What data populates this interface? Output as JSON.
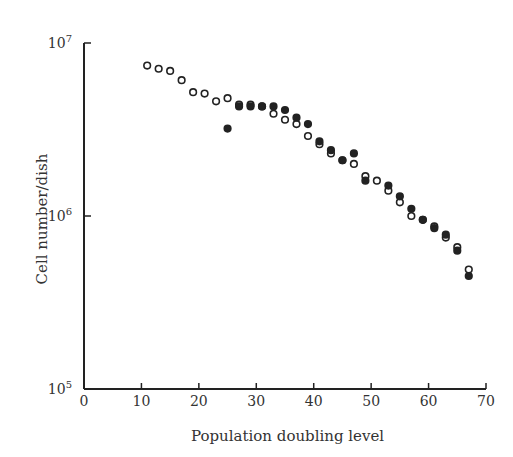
{
  "chart_data": {
    "type": "scatter",
    "title": "",
    "xlabel": "Population doubling level",
    "ylabel": "Cell number/dish",
    "xlim": [
      0,
      70
    ],
    "ylim": [
      100000,
      10000000
    ],
    "yscale": "log",
    "x_ticks": [
      "0",
      "10",
      "20",
      "30",
      "40",
      "50",
      "60",
      "70"
    ],
    "y_ticks": [
      "10^5",
      "10^6",
      "10^7"
    ],
    "grid": false,
    "legend": null,
    "series": [
      {
        "name": "open circles",
        "marker": "open",
        "x": [
          11,
          13,
          15,
          17,
          19,
          21,
          23,
          25,
          27,
          29,
          31,
          33,
          35,
          37,
          39,
          41,
          43,
          45,
          47,
          49,
          51,
          53,
          55,
          57,
          59,
          61,
          63,
          65,
          67
        ],
        "y": [
          7400000,
          7100000,
          6900000,
          6100000,
          5200000,
          5100000,
          4600000,
          4800000,
          4400000,
          4400000,
          4300000,
          3900000,
          3600000,
          3400000,
          2900000,
          2600000,
          2300000,
          2100000,
          2000000,
          1700000,
          1600000,
          1400000,
          1200000,
          1000000,
          950000,
          870000,
          750000,
          660000,
          490000
        ]
      },
      {
        "name": "filled circles",
        "marker": "filled",
        "x": [
          25,
          27,
          29,
          31,
          33,
          35,
          37,
          39,
          41,
          43,
          45,
          47,
          49,
          53,
          55,
          57,
          59,
          61,
          63,
          65,
          67
        ],
        "y": [
          3200000,
          4300000,
          4300000,
          4300000,
          4300000,
          4100000,
          3700000,
          3400000,
          2700000,
          2400000,
          2100000,
          2300000,
          1600000,
          1500000,
          1300000,
          1100000,
          950000,
          850000,
          780000,
          630000,
          450000
        ]
      }
    ]
  }
}
